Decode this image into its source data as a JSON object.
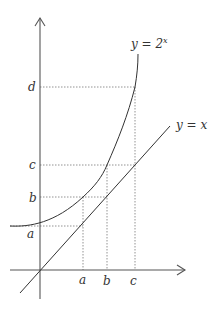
{
  "diagram": {
    "curve_label": "y = 2",
    "curve_exponent": "x",
    "line_label": "y = x",
    "y_ticks": [
      "d",
      "c",
      "b",
      "a"
    ],
    "x_ticks": [
      "a",
      "b",
      "c"
    ],
    "colors": {
      "axis": "#555555",
      "curve": "#333333",
      "guide": "#777777"
    }
  }
}
